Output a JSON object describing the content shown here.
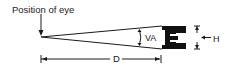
{
  "diagram": {
    "labels": {
      "eye": "Position of eye",
      "visual_angle": "VA",
      "height": "H",
      "distance": "D"
    },
    "target_letter": "E",
    "colors": {
      "line": "#1a1a1a",
      "letter": "#111111",
      "background": "#ffffff"
    }
  }
}
